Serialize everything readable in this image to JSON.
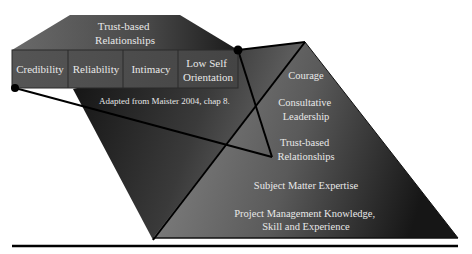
{
  "diagram": {
    "trust_header": [
      "Trust-based",
      "Relationships"
    ],
    "components": [
      {
        "lines": [
          "Credibility"
        ]
      },
      {
        "lines": [
          "Reliability"
        ]
      },
      {
        "lines": [
          "Intimacy"
        ]
      },
      {
        "lines": [
          "Low Self",
          "Orientation"
        ]
      }
    ],
    "citation": "Adapted from Maister 2004, chap 8.",
    "pyramid_levels": [
      {
        "lines": [
          "Courage"
        ]
      },
      {
        "lines": [
          "Consultative",
          "Leadership"
        ]
      },
      {
        "lines": [
          "Trust-based",
          "Relationships"
        ]
      },
      {
        "lines": [
          "Subject Matter Expertise"
        ]
      },
      {
        "lines": [
          "Project Management Knowledge,",
          "Skill and Experience"
        ]
      }
    ]
  }
}
